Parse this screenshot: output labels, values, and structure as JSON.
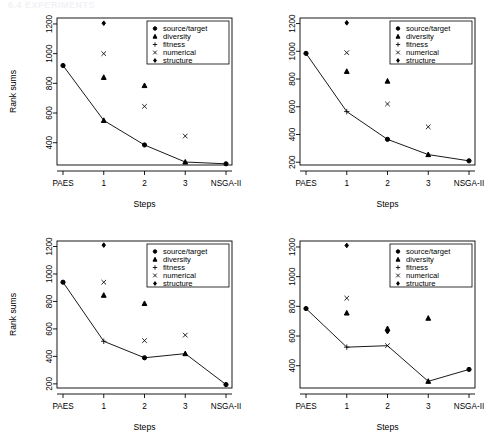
{
  "page_header_faint": "6.4    EXPERIMENTS",
  "legend": {
    "entries": [
      {
        "label": "source/target",
        "symbol": "filled-circle"
      },
      {
        "label": "diversity",
        "symbol": "filled-triangle"
      },
      {
        "label": "fitness",
        "symbol": "plus"
      },
      {
        "label": "numerical",
        "symbol": "cross"
      },
      {
        "label": "structure",
        "symbol": "filled-diamond"
      }
    ]
  },
  "axis_titles": {
    "x": "Steps",
    "y": "Rank sums"
  },
  "chart_data": [
    {
      "type": "line",
      "panel": "top-left",
      "title": "",
      "xlabel": "Steps",
      "ylabel": "Rank sums",
      "categories": [
        "PAES",
        "1",
        "2",
        "3",
        "NSGA-II"
      ],
      "yticks": [
        400,
        600,
        800,
        1000,
        1200
      ],
      "ylim": [
        250,
        1240
      ],
      "grid": false,
      "legend_position": "top-right",
      "series": [
        {
          "name": "best-per-step-line",
          "values": [
            920,
            550,
            385,
            270,
            258
          ],
          "markers": [
            "filled-circle",
            "filled-triangle",
            "filled-circle",
            "filled-triangle",
            "filled-circle"
          ]
        }
      ],
      "points": [
        {
          "x": "1",
          "y": 1205,
          "symbol": "filled-diamond",
          "series": "structure"
        },
        {
          "x": "1",
          "y": 1000,
          "symbol": "cross",
          "series": "numerical"
        },
        {
          "x": "1",
          "y": 840,
          "symbol": "filled-triangle",
          "series": "diversity"
        },
        {
          "x": "2",
          "y": 785,
          "symbol": "filled-triangle",
          "series": "diversity"
        },
        {
          "x": "2",
          "y": 645,
          "symbol": "cross",
          "series": "numerical"
        },
        {
          "x": "3",
          "y": 445,
          "symbol": "cross",
          "series": "numerical"
        }
      ]
    },
    {
      "type": "line",
      "panel": "top-right",
      "title": "",
      "xlabel": "Steps",
      "ylabel": "",
      "categories": [
        "PAES",
        "1",
        "2",
        "3",
        "NSGA-II"
      ],
      "yticks": [
        200,
        400,
        600,
        800,
        1000,
        1200
      ],
      "ylim": [
        180,
        1240
      ],
      "grid": false,
      "legend_position": "top-right",
      "series": [
        {
          "name": "best-per-step-line",
          "values": [
            985,
            565,
            365,
            255,
            210
          ],
          "markers": [
            "filled-circle",
            "plus",
            "filled-circle",
            "filled-triangle",
            "filled-circle"
          ]
        }
      ],
      "points": [
        {
          "x": "1",
          "y": 1205,
          "symbol": "filled-diamond",
          "series": "structure"
        },
        {
          "x": "1",
          "y": 990,
          "symbol": "cross",
          "series": "numerical"
        },
        {
          "x": "1",
          "y": 855,
          "symbol": "filled-triangle",
          "series": "diversity"
        },
        {
          "x": "2",
          "y": 785,
          "symbol": "filled-triangle",
          "series": "diversity"
        },
        {
          "x": "2",
          "y": 620,
          "symbol": "cross",
          "series": "numerical"
        },
        {
          "x": "3",
          "y": 455,
          "symbol": "cross",
          "series": "numerical"
        }
      ]
    },
    {
      "type": "line",
      "panel": "bottom-left",
      "title": "",
      "xlabel": "Steps",
      "ylabel": "Rank sums",
      "categories": [
        "PAES",
        "1",
        "2",
        "3",
        "NSGA-II"
      ],
      "yticks": [
        200,
        400,
        600,
        800,
        1000,
        1200
      ],
      "ylim": [
        170,
        1240
      ],
      "grid": false,
      "legend_position": "top-right",
      "series": [
        {
          "name": "best-per-step-line",
          "values": [
            940,
            510,
            390,
            420,
            195
          ],
          "markers": [
            "filled-circle",
            "plus",
            "filled-circle",
            "filled-triangle",
            "filled-circle"
          ]
        }
      ],
      "points": [
        {
          "x": "1",
          "y": 1210,
          "symbol": "filled-diamond",
          "series": "structure"
        },
        {
          "x": "1",
          "y": 940,
          "symbol": "cross",
          "series": "numerical"
        },
        {
          "x": "1",
          "y": 845,
          "symbol": "filled-triangle",
          "series": "diversity"
        },
        {
          "x": "2",
          "y": 785,
          "symbol": "filled-triangle",
          "series": "diversity"
        },
        {
          "x": "2",
          "y": 515,
          "symbol": "cross",
          "series": "numerical"
        },
        {
          "x": "3",
          "y": 555,
          "symbol": "cross",
          "series": "numerical"
        }
      ]
    },
    {
      "type": "line",
      "panel": "bottom-right",
      "title": "",
      "xlabel": "Steps",
      "ylabel": "",
      "categories": [
        "PAES",
        "1",
        "2",
        "3",
        "NSGA-II"
      ],
      "yticks": [
        400,
        600,
        800,
        1000,
        1200
      ],
      "ylim": [
        250,
        1240
      ],
      "grid": false,
      "legend_position": "top-right",
      "series": [
        {
          "name": "best-per-step-line",
          "values": [
            785,
            525,
            535,
            295,
            375
          ],
          "markers": [
            "filled-circle",
            "plus",
            "cross",
            "filled-triangle",
            "filled-circle"
          ]
        }
      ],
      "points": [
        {
          "x": "1",
          "y": 1210,
          "symbol": "filled-diamond",
          "series": "structure"
        },
        {
          "x": "1",
          "y": 855,
          "symbol": "cross",
          "series": "numerical"
        },
        {
          "x": "1",
          "y": 755,
          "symbol": "filled-triangle",
          "series": "diversity"
        },
        {
          "x": "2",
          "y": 650,
          "symbol": "filled-triangle",
          "series": "diversity"
        },
        {
          "x": "2",
          "y": 630,
          "symbol": "filled-diamond",
          "series": "structure"
        },
        {
          "x": "3",
          "y": 720,
          "symbol": "filled-triangle",
          "series": "diversity"
        }
      ]
    }
  ]
}
